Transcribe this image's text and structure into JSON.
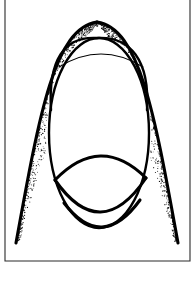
{
  "figure": {
    "title": "Pointed arch and ovoid line illustration",
    "background_color": "#ffffff",
    "ink_color": "#000000",
    "frame_color": "#2b2b2b",
    "width": 196,
    "height": 282,
    "frame": {
      "name": "border-frame",
      "left": 5,
      "top": -3,
      "right": 190,
      "bottom": 261,
      "stroke_width": 1.1
    },
    "shapes": [
      {
        "name": "outer-arch",
        "type": "pointed-arch",
        "stroke": "thick",
        "apex_x": 97,
        "apex_y": 22,
        "left_foot_x": 16,
        "left_foot_y": 243,
        "right_foot_x": 178,
        "right_foot_y": 243
      },
      {
        "name": "inner-arch",
        "type": "arch-crown",
        "stroke": "medium",
        "apex_x": 97,
        "apex_y": 38
      },
      {
        "name": "central-ovoid",
        "type": "ellipse",
        "stroke": "medium",
        "center_x": 99,
        "center_y": 133,
        "radius_x": 50,
        "radius_y": 95
      },
      {
        "name": "upper-chord-arc",
        "type": "arc",
        "stroke": "thin",
        "start_x": 59,
        "start_y": 67,
        "end_x": 143,
        "end_y": 67,
        "apex_y": 54
      },
      {
        "name": "lower-lens-arc-upper",
        "type": "arc",
        "stroke": "thick",
        "start_x": 55,
        "start_y": 180,
        "end_x": 146,
        "end_y": 178,
        "apex_y": 156
      },
      {
        "name": "lower-lens-arc-middle",
        "type": "arc",
        "stroke": "thick",
        "start_x": 55,
        "start_y": 180,
        "end_x": 146,
        "end_y": 178,
        "apex_y": 212
      },
      {
        "name": "lower-lens-arc-bottom",
        "type": "arc",
        "stroke": "thick",
        "start_x": 64,
        "start_y": 203,
        "end_x": 140,
        "end_y": 200,
        "apex_y": 227
      }
    ],
    "shading": {
      "name": "stipple-shading",
      "style": "stipple",
      "description": "Graded dot stipple filling the band between the outer arch and the inner ovoid, densest along the outer arch line and fading inward.",
      "dot_color": "#111111",
      "density": "graded",
      "seed": 20240617,
      "dot_count": 1500
    },
    "labels": []
  }
}
